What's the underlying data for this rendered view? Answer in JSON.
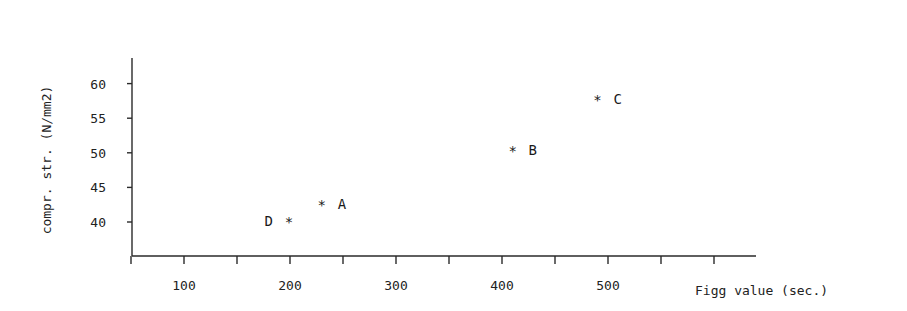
{
  "chart_data": {
    "type": "scatter",
    "title": "",
    "xlabel": "Figg value (sec.)",
    "ylabel": "compr. str. (N/mm2)",
    "xlim": [
      0,
      670
    ],
    "ylim": [
      35.1,
      63.6
    ],
    "x_ticks": [
      50,
      100,
      150,
      200,
      250,
      300,
      350,
      400,
      450,
      500,
      550,
      600
    ],
    "x_tick_labels": [
      "100",
      "200",
      "300",
      "400",
      "500"
    ],
    "x_tick_label_values": [
      100,
      200,
      300,
      400,
      500
    ],
    "y_ticks": [
      40,
      45,
      50,
      55,
      60
    ],
    "y_tick_labels": [
      "40",
      "45",
      "50",
      "55",
      "60"
    ],
    "grid": false,
    "marker": "*",
    "points": [
      {
        "label": "A",
        "x": 230,
        "y": 42.6,
        "label_side": "right"
      },
      {
        "label": "B",
        "x": 410,
        "y": 50.4,
        "label_side": "right"
      },
      {
        "label": "C",
        "x": 490,
        "y": 57.8,
        "label_side": "right"
      },
      {
        "label": "D",
        "x": 199,
        "y": 40.1,
        "label_side": "left"
      }
    ]
  }
}
